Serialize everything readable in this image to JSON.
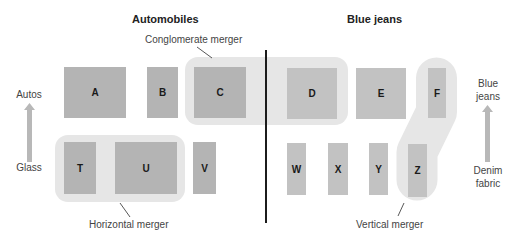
{
  "headings": {
    "left": "Automobiles",
    "right": "Blue jeans"
  },
  "axis_left": {
    "top_label": "Autos",
    "bottom_label": "Glass",
    "arrow": "up-arrow-icon"
  },
  "axis_right": {
    "top_label": "Blue jeans",
    "top_label_lines": [
      "Blue",
      "jeans"
    ],
    "bottom_label_lines": [
      "Denim",
      "fabric"
    ],
    "arrow": "up-arrow-icon"
  },
  "firms": {
    "upstream_auto": [
      "A",
      "B",
      "C"
    ],
    "downstream_auto": [
      "T",
      "U",
      "V"
    ],
    "upstream_jeans": [
      "D",
      "E",
      "F"
    ],
    "downstream_jeans": [
      "W",
      "X",
      "Y",
      "Z"
    ]
  },
  "mergers": {
    "conglomerate": {
      "label": "Conglomerate merger",
      "firms": [
        "C",
        "D"
      ]
    },
    "horizontal": {
      "label": "Horizontal merger",
      "firms": [
        "T",
        "U"
      ]
    },
    "vertical": {
      "label": "Vertical merger",
      "firms": [
        "F",
        "Z"
      ]
    }
  },
  "colors": {
    "box": "#b4b4b4",
    "highlight": "#e6e6e6",
    "divider": "#1c1c1c",
    "arrow": "#b8b8b8"
  }
}
